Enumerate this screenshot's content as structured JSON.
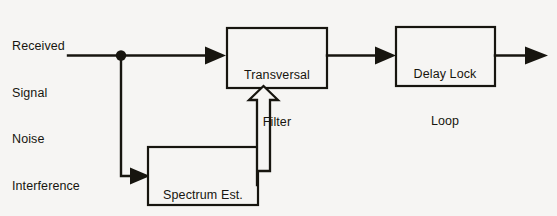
{
  "figure": {
    "kind": "block-diagram",
    "background_color": "#f6f5f3",
    "ink_color": "#17150f"
  },
  "input_label": {
    "line1": "Received",
    "line2": "Signal",
    "line3": "Noise",
    "line4": "Interference"
  },
  "blocks": {
    "transversal_filter": {
      "line1": "Transversal",
      "line2": "Filter"
    },
    "delay_lock_loop": {
      "line1": "Delay Lock",
      "line2": "Loop"
    },
    "spectrum_estimator": {
      "line1": "Spectrum Est.",
      "line2": "DFT"
    }
  },
  "connections": {
    "input_to_filter": "solid arrow",
    "filter_to_dll": "solid arrow",
    "dll_output": "solid arrow",
    "tap_to_spectrum": "solid arrow",
    "spectrum_to_filter": "hollow block arrow"
  }
}
